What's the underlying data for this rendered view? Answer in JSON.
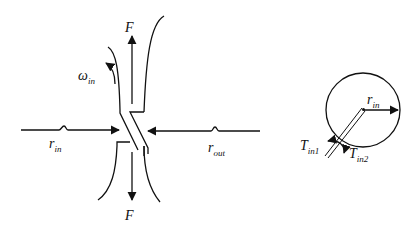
{
  "diagram": {
    "left_figure": {
      "force_top": {
        "symbol": "F"
      },
      "force_bottom": {
        "symbol": "F"
      },
      "angular_velocity": {
        "symbol": "ω",
        "subscript": "in"
      },
      "inner_resistance": {
        "symbol": "r",
        "subscript": "in"
      },
      "outer_resistance": {
        "symbol": "r",
        "subscript": "out"
      }
    },
    "right_figure": {
      "radius": {
        "symbol": "r",
        "subscript": "in"
      },
      "torque_1": {
        "symbol": "T",
        "subscript": "in1"
      },
      "torque_2": {
        "symbol": "T",
        "subscript": "in2"
      }
    },
    "colors": {
      "ink": "#111111",
      "background": "#ffffff"
    }
  }
}
